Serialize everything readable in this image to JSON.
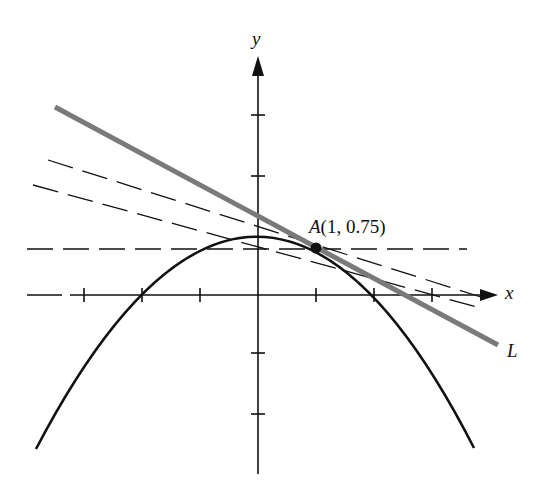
{
  "figure": {
    "axes": {
      "x_label": "x",
      "y_label": "y",
      "origin_px": [
        258,
        295
      ],
      "unit_px": 58,
      "x_ticks": [
        -3,
        -2,
        -1,
        1,
        2,
        3
      ],
      "y_ticks": [
        -2,
        -1,
        1,
        2
      ]
    },
    "curve": {
      "name": "parabola",
      "equation": "y = 1 - x^2/4",
      "color": "#111111"
    },
    "point": {
      "label_name": "A",
      "label_coords": "(1, 0.75)",
      "x": 1,
      "y": 0.75
    },
    "tangent_line": {
      "label": "L",
      "slope": -0.5,
      "color": "#777777"
    },
    "secant_lines": [
      {
        "style": "dashed",
        "slope": 0
      },
      {
        "style": "dashed",
        "slope": -0.31
      },
      {
        "style": "dashed",
        "slope": -0.27
      }
    ]
  }
}
